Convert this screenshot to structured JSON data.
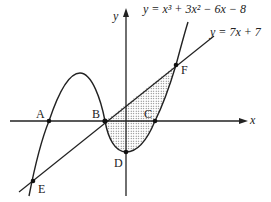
{
  "equations": {
    "curve": "y = x³ + 3x² − 6x − 8",
    "line": "y = 7x + 7"
  },
  "axes": {
    "x_label": "x",
    "y_label": "y"
  },
  "points": {
    "A": "A",
    "B": "B",
    "C": "C",
    "D": "D",
    "E": "E",
    "F": "F"
  },
  "shading": "dotted region between line and curve from B to F"
}
